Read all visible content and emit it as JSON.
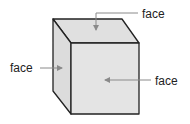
{
  "diagram": {
    "colors": {
      "face_fill_front": "#e4e4e4",
      "face_fill_top": "#e0e0e0",
      "face_fill_side": "#dcdcdc",
      "edge": "#222222",
      "arrow": "#8a8a8a",
      "label": "#222222"
    },
    "labels": {
      "top": "face",
      "left": "face",
      "right": "face"
    }
  }
}
